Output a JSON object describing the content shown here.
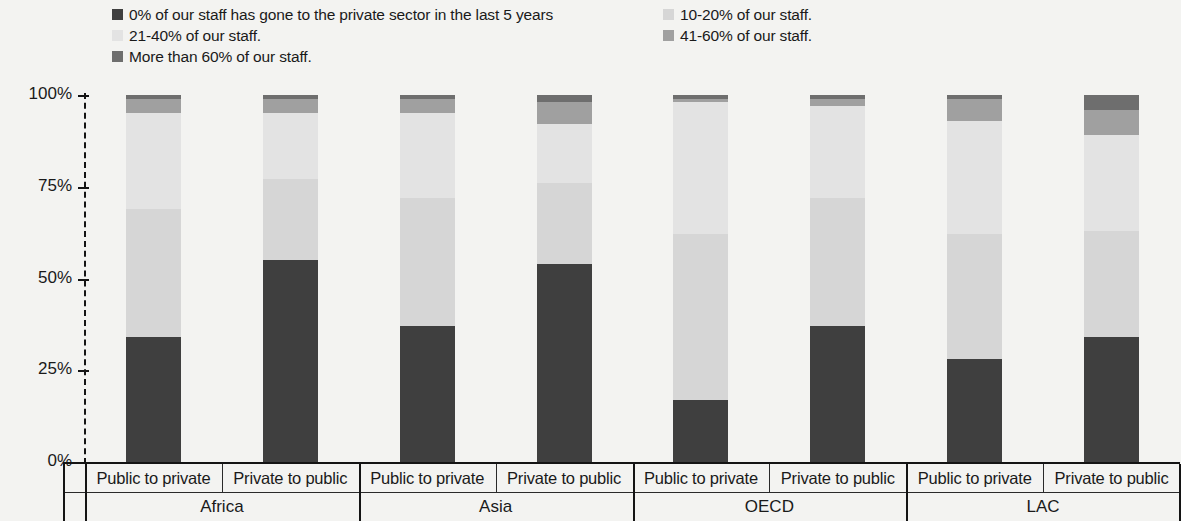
{
  "legend": {
    "items": [
      {
        "label": "0% of our staff has gone to the private sector in the last 5 years",
        "color": "#3f3f3f",
        "col": 0,
        "row": 0
      },
      {
        "label": "10-20% of our staff.",
        "color": "#d6d6d6",
        "col": 1,
        "row": 0
      },
      {
        "label": "21-40% of our staff.",
        "color": "#e3e3e3",
        "col": 0,
        "row": 1
      },
      {
        "label": "41-60% of our staff.",
        "color": "#a0a0a0",
        "col": 1,
        "row": 1
      },
      {
        "label": "More than 60% of our staff.",
        "color": "#6e6e6e",
        "col": 0,
        "row": 2
      }
    ]
  },
  "axis": {
    "y_ticks": [
      "100%",
      "75%",
      "50%",
      "25%",
      "0%"
    ],
    "y_values": [
      100,
      75,
      50,
      25,
      0
    ]
  },
  "groups": [
    {
      "name": "Africa",
      "categories": [
        "Public to private",
        "Private to public"
      ]
    },
    {
      "name": "Asia",
      "categories": [
        "Public to private",
        "Private to public"
      ]
    },
    {
      "name": "OECD",
      "categories": [
        "Public to private",
        "Private to public"
      ]
    },
    {
      "name": "LAC",
      "categories": [
        "Public to private",
        "Private to public"
      ]
    }
  ],
  "chart_data": {
    "type": "bar",
    "stacked": true,
    "stack_total": 100,
    "title": "",
    "xlabel": "",
    "ylabel": "",
    "ylim": [
      0,
      100
    ],
    "grid": false,
    "legend_position": "top",
    "categories": [
      "Africa / Public to private",
      "Africa / Private to public",
      "Asia / Public to private",
      "Asia / Private to public",
      "OECD / Public to private",
      "OECD / Private to public",
      "LAC / Public to private",
      "LAC / Private to public"
    ],
    "series": [
      {
        "name": "0% of our staff has gone to the private sector in the last 5 years",
        "color": "#3f3f3f",
        "values": [
          34,
          55,
          37,
          54,
          17,
          37,
          28,
          34
        ]
      },
      {
        "name": "10-20% of our staff.",
        "color": "#d6d6d6",
        "values": [
          35,
          22,
          35,
          22,
          45,
          35,
          34,
          29
        ]
      },
      {
        "name": "21-40% of our staff.",
        "color": "#e3e3e3",
        "values": [
          26,
          18,
          23,
          16,
          36,
          25,
          31,
          26
        ]
      },
      {
        "name": "41-60% of our staff.",
        "color": "#a0a0a0",
        "values": [
          4,
          4,
          4,
          6,
          1,
          2,
          6,
          7
        ]
      },
      {
        "name": "More than 60% of our staff.",
        "color": "#6e6e6e",
        "values": [
          1,
          1,
          1,
          2,
          1,
          1,
          1,
          4
        ]
      }
    ]
  }
}
